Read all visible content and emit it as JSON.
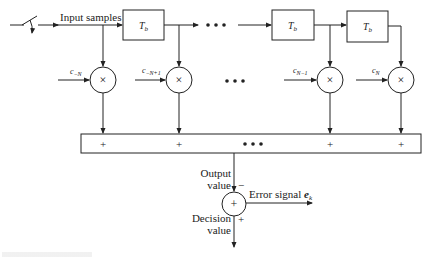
{
  "diagram": {
    "type": "adaptive linear equalizer (tapped delay line)",
    "input_label": "Input samples",
    "delay_label": "T",
    "delay_subscript": "b",
    "delay_count": 3,
    "ellipsis": "•••",
    "coefficients": [
      {
        "base": "c",
        "sub": "−N"
      },
      {
        "base": "c",
        "sub": "−N+1"
      },
      {
        "base": "c",
        "sub": "N−1"
      },
      {
        "base": "c",
        "sub": "N"
      }
    ],
    "multiplier_symbol": "×",
    "summer_plus": "+",
    "output_label_line1": "Output",
    "output_label_line2": "value",
    "minus_sign": "−",
    "plus_sign": "+",
    "error_label": "Error signal ",
    "error_symbol": "e",
    "error_subscript": "k",
    "decision_label_line1": "Decision",
    "decision_label_line2": "value",
    "sum_node_symbol": "+"
  },
  "caption": {
    "text_visible": false
  }
}
